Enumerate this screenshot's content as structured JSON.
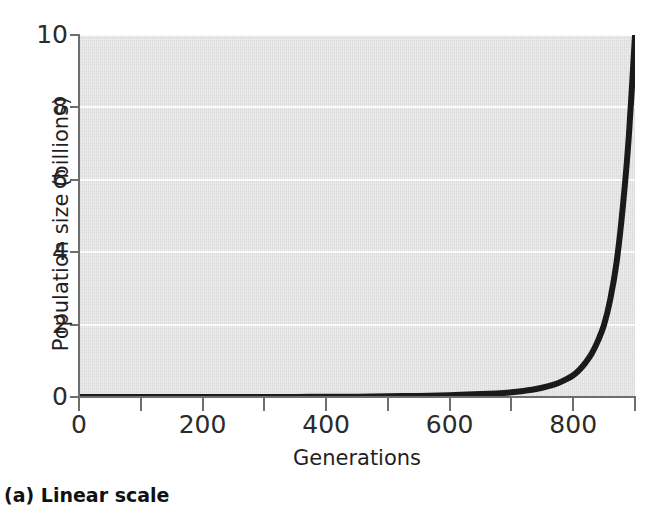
{
  "figure": {
    "caption": "(a) Linear scale"
  },
  "chart_data": {
    "type": "line",
    "title": "",
    "subtitle": "",
    "xlabel": "Generations",
    "ylabel": "Population size (billions)",
    "xlim": [
      0,
      900
    ],
    "ylim": [
      0,
      10
    ],
    "grid": "horizontal-white-gridlines-at-major-y-ticks",
    "legend": "none",
    "plot_background_color": "#e2e2e2",
    "gridline_color": "#fbfbfb",
    "line_color": "#1a1a1a",
    "line_width_px": 6,
    "x_ticks_major": [
      0,
      200,
      400,
      600,
      800
    ],
    "x_tick_labels": [
      "0",
      "200",
      "400",
      "600",
      "800"
    ],
    "x_ticks_minor": [
      100,
      300,
      500,
      700,
      900
    ],
    "y_ticks": [
      0,
      2,
      4,
      6,
      8,
      10
    ],
    "y_tick_labels": [
      "0",
      "2",
      "4",
      "6",
      "8",
      "10"
    ],
    "series": [
      {
        "name": "Exponential population growth",
        "x": [
          0,
          50,
          100,
          150,
          200,
          250,
          300,
          350,
          400,
          450,
          500,
          550,
          600,
          650,
          675,
          700,
          720,
          740,
          760,
          775,
          790,
          800,
          810,
          820,
          830,
          840,
          850,
          860,
          870,
          880,
          890,
          900
        ],
        "y": [
          0.0,
          0.0,
          0.0,
          0.0,
          0.0,
          0.0,
          0.0,
          0.0,
          0.01,
          0.01,
          0.02,
          0.03,
          0.05,
          0.08,
          0.1,
          0.13,
          0.17,
          0.22,
          0.3,
          0.38,
          0.5,
          0.6,
          0.75,
          0.95,
          1.2,
          1.55,
          2.0,
          2.7,
          3.7,
          5.2,
          7.2,
          10.0
        ]
      }
    ]
  }
}
